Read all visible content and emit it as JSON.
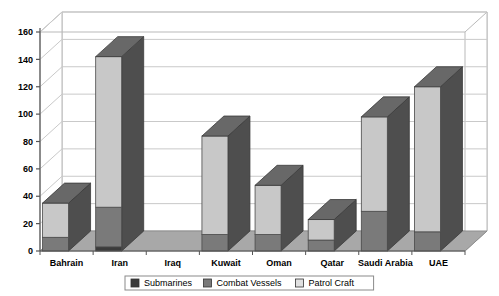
{
  "chart_data": {
    "type": "bar",
    "stacked": true,
    "title": "",
    "subtitle": "",
    "xlabel": "",
    "ylabel": "",
    "ylim": [
      0,
      160
    ],
    "ytick_step": 20,
    "yticks": [
      0,
      20,
      40,
      60,
      80,
      100,
      120,
      140,
      160
    ],
    "ytick_labels": [
      "0",
      "20",
      "40",
      "60",
      "80",
      "100",
      "120",
      "140",
      "160"
    ],
    "grid": true,
    "grid_axis": "y",
    "legend_position": "bottom",
    "three_d": true,
    "categories": [
      "Bahrain",
      "Iran",
      "Iraq",
      "Kuwait",
      "Oman",
      "Qatar",
      "Saudi Arabia",
      "UAE"
    ],
    "series": [
      {
        "name": "Submarines",
        "color": "#3b3b3b",
        "values": [
          0,
          3,
          0,
          0,
          0,
          0,
          0,
          0
        ]
      },
      {
        "name": "Combat Vessels",
        "color": "#7a7a7a",
        "values": [
          10,
          29,
          0,
          12,
          12,
          8,
          29,
          14
        ]
      },
      {
        "name": "Patrol Craft",
        "color": "#c8c8c8",
        "values": [
          25,
          110,
          0,
          72,
          36,
          15,
          69,
          106
        ]
      }
    ],
    "totals": [
      35,
      142,
      0,
      84,
      48,
      23,
      98,
      120
    ]
  },
  "legend": {
    "items": [
      {
        "label": "Submarines",
        "swatch": "#3b3b3b"
      },
      {
        "label": "Combat Vessels",
        "swatch": "#7a7a7a"
      },
      {
        "label": "Patrol Craft",
        "swatch": "#e0e0e0"
      }
    ]
  },
  "colors": {
    "plot_background": "#ffffff",
    "floor": "#a8a8a8",
    "wall_line": "#b9b9b9",
    "gridline": "#c9c9c9",
    "axis": "#555555",
    "bar_top": "#686868",
    "bar_side": "#4e4e4e",
    "legend_border": "#8a8a8a"
  }
}
